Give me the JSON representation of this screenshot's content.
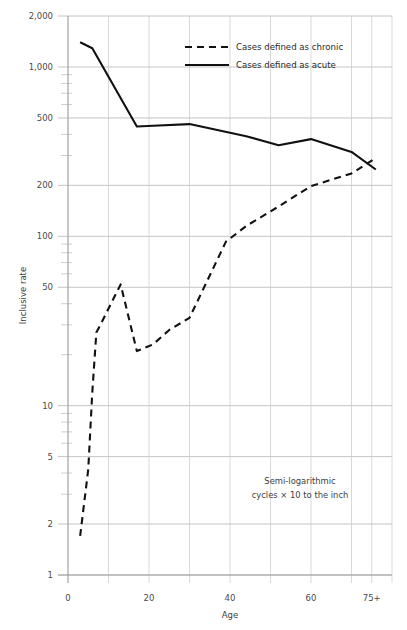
{
  "chart_data": {
    "type": "line",
    "title": "",
    "xlabel": "Age",
    "ylabel": "Inclusive rate",
    "yscale": "log",
    "ylim": [
      1,
      2000
    ],
    "xlim": [
      0,
      80
    ],
    "grid": true,
    "legend_position": "top-center",
    "annotation": {
      "line1": "Semi-logarithmic",
      "line2": "cycles × 10 to the inch"
    },
    "y_ticks": [
      {
        "value": 1,
        "label": "1"
      },
      {
        "value": 2,
        "label": "2"
      },
      {
        "value": 5,
        "label": "5"
      },
      {
        "value": 10,
        "label": "10"
      },
      {
        "value": 50,
        "label": "50"
      },
      {
        "value": 100,
        "label": "100"
      },
      {
        "value": 200,
        "label": "200"
      },
      {
        "value": 500,
        "label": "500"
      },
      {
        "value": 1000,
        "label": "1,000"
      },
      {
        "value": 2000,
        "label": "2,000"
      }
    ],
    "y_minor_ticks": [
      3,
      4,
      6,
      7,
      8,
      9,
      20,
      30,
      40,
      60,
      70,
      80,
      90,
      300,
      400,
      600,
      700,
      800,
      900
    ],
    "x_ticks": [
      {
        "value": 0,
        "label": "0"
      },
      {
        "value": 20,
        "label": "20"
      },
      {
        "value": 40,
        "label": "40"
      },
      {
        "value": 60,
        "label": "60"
      },
      {
        "value": 75,
        "label": "75+"
      }
    ],
    "x_gridlines": [
      0,
      10,
      20,
      30,
      40,
      50,
      60,
      70,
      75,
      80
    ],
    "series": [
      {
        "name": "Cases defined as chronic",
        "style": "dashed",
        "color": "#111111",
        "points": [
          {
            "x": 3,
            "y": 1.7
          },
          {
            "x": 5,
            "y": 4.2
          },
          {
            "x": 6,
            "y": 12
          },
          {
            "x": 7,
            "y": 27
          },
          {
            "x": 8,
            "y": 30
          },
          {
            "x": 13,
            "y": 52
          },
          {
            "x": 17,
            "y": 21
          },
          {
            "x": 21,
            "y": 23
          },
          {
            "x": 25,
            "y": 28
          },
          {
            "x": 30,
            "y": 33
          },
          {
            "x": 39,
            "y": 93
          },
          {
            "x": 44,
            "y": 115
          },
          {
            "x": 52,
            "y": 150
          },
          {
            "x": 60,
            "y": 198
          },
          {
            "x": 70,
            "y": 235
          },
          {
            "x": 76,
            "y": 290
          }
        ]
      },
      {
        "name": "Cases defined as acute",
        "style": "solid",
        "color": "#111111",
        "points": [
          {
            "x": 3,
            "y": 1400
          },
          {
            "x": 6,
            "y": 1290
          },
          {
            "x": 17,
            "y": 445
          },
          {
            "x": 21,
            "y": 450
          },
          {
            "x": 30,
            "y": 460
          },
          {
            "x": 44,
            "y": 390
          },
          {
            "x": 52,
            "y": 345
          },
          {
            "x": 60,
            "y": 375
          },
          {
            "x": 70,
            "y": 315
          },
          {
            "x": 76,
            "y": 248
          }
        ]
      }
    ]
  },
  "legend": {
    "items": [
      {
        "label": "Cases defined as chronic",
        "style": "dashed"
      },
      {
        "label": "Cases defined as acute",
        "style": "solid"
      }
    ]
  }
}
